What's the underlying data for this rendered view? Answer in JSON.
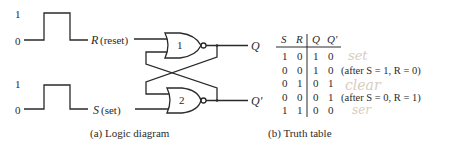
{
  "diagram": {
    "pulses": {
      "top": {
        "high_label": "1",
        "low_label": "0",
        "signal_label": "R",
        "signal_note": "(reset)"
      },
      "bottom": {
        "high_label": "1",
        "low_label": "0",
        "signal_label": "S",
        "signal_note": "(set)"
      }
    },
    "gates": [
      {
        "label": "1",
        "type": "NOR"
      },
      {
        "label": "2",
        "type": "NOR"
      }
    ],
    "outputs": {
      "q": "Q",
      "q_prime": "Q′"
    },
    "caption": "(a)  Logic diagram"
  },
  "truth_table": {
    "headers": [
      "S",
      "R",
      "Q",
      "Q′"
    ],
    "rows": [
      {
        "cells": [
          "1",
          "0",
          "1",
          "0"
        ],
        "note": ""
      },
      {
        "cells": [
          "0",
          "0",
          "1",
          "0"
        ],
        "note": "(after S = 1, R = 0)"
      },
      {
        "cells": [
          "0",
          "1",
          "0",
          "1"
        ],
        "note": ""
      },
      {
        "cells": [
          "0",
          "0",
          "0",
          "1"
        ],
        "note": "(after S = 0, R = 1)"
      },
      {
        "cells": [
          "1",
          "1",
          "0",
          "0"
        ],
        "note": ""
      }
    ],
    "caption": "(b)  Truth table"
  },
  "handwriting": [
    "set",
    "clear",
    "ser"
  ]
}
